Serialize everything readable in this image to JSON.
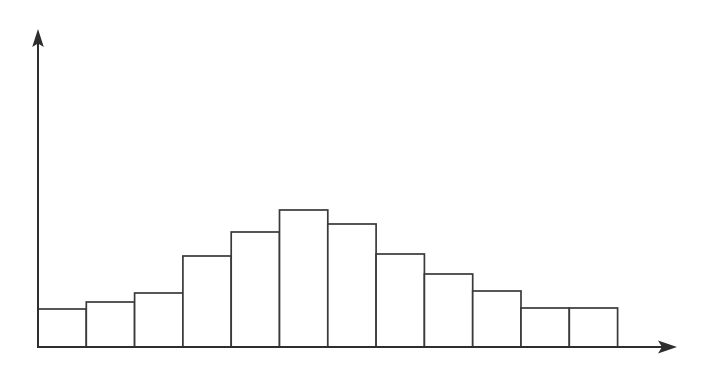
{
  "figure": {
    "kind": "hand-drawn-histogram-sketch",
    "background_color": "#ffffff",
    "line_color": "#3a3a3a",
    "axis_color": "#2e2e2e",
    "width": 712,
    "height": 372
  },
  "chart_data": {
    "type": "bar",
    "title": "",
    "subtitle": "",
    "xlabel": "",
    "ylabel": "",
    "grid": false,
    "legend": null,
    "legend_position": "none",
    "annotations": [],
    "categories": [
      "1",
      "2",
      "3",
      "4",
      "5",
      "6",
      "7",
      "8",
      "9",
      "10",
      "11",
      "12"
    ],
    "tick_labels_x": [],
    "tick_labels_y": [],
    "values": [
      38,
      45,
      54,
      91,
      115,
      137,
      123,
      93,
      73,
      56,
      39,
      39
    ],
    "ylim": [
      0,
      317
    ],
    "xlim": [
      0,
      12
    ],
    "bar_edges_px": [
      38,
      86.3,
      134.6,
      182.9,
      231.2,
      279.5,
      327.8,
      376.1,
      424.4,
      472.7,
      521.0,
      569.3,
      617.6
    ],
    "baseline_y_px": 347,
    "bar_fill": "#ffffff",
    "bar_stroke": "#3a3a3a"
  },
  "axes": {
    "y_axis": {
      "name": "vertical-axis",
      "x_px": 38,
      "top_px": 30,
      "bottom_px": 347,
      "arrow": "up"
    },
    "x_axis": {
      "name": "horizontal-axis",
      "y_px": 347,
      "left_px": 38,
      "right_px": 677,
      "arrow": "right"
    }
  }
}
